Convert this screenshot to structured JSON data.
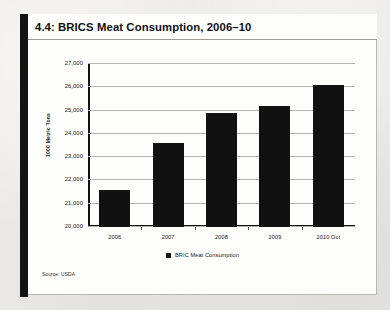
{
  "card": {
    "title": "4.4: BRICS Meat Consumption, 2006–10",
    "source_note": "Source: USDA"
  },
  "chart_data": {
    "type": "bar",
    "title": "4.4: BRICS Meat Consumption, 2006–10",
    "categories": [
      "2006",
      "2007",
      "2008",
      "2009",
      "2010 Oct"
    ],
    "values": [
      21600,
      23600,
      24900,
      25200,
      26100
    ],
    "series": [
      {
        "name": "BRIC Meat Consumption",
        "values": [
          21600,
          23600,
          24900,
          25200,
          26100
        ],
        "color": "#111111"
      }
    ],
    "xlabel": "",
    "ylabel": "1000 Metric Tons",
    "ylim": [
      20000,
      27000
    ],
    "ytick_values": [
      20000,
      21000,
      22000,
      23000,
      24000,
      25000,
      26000,
      27000
    ],
    "ytick_labels": [
      "20,000",
      "21,000",
      "22,000",
      "23,000",
      "24,000",
      "25,000",
      "26,000",
      "27,000"
    ],
    "grid": true,
    "legend_position": "bottom",
    "legend": [
      "BRIC Meat Consumption"
    ]
  }
}
